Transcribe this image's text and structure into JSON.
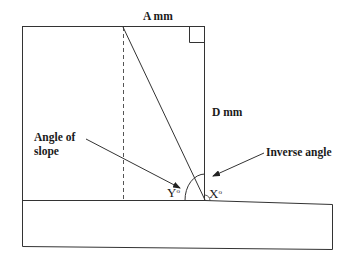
{
  "diagram": {
    "labels": {
      "top_dimension": "A mm",
      "side_dimension": "D mm",
      "angle_of_slope_line1": "Angle of",
      "angle_of_slope_line2": "slope",
      "inverse_angle": "Inverse angle",
      "angle_y": "Y",
      "angle_x": "X",
      "degree_symbol": "o"
    },
    "colors": {
      "stroke": "#333333",
      "text": "#1a1a1a",
      "background": "#ffffff"
    }
  }
}
